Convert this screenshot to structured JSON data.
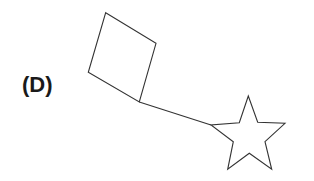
{
  "option_label": "(D)",
  "figure": {
    "stroke_color": "#333333",
    "fill_color": "#ffffff",
    "shapes": [
      {
        "name": "square",
        "points": "105.7,12.7 156,43.3 139.3,102 88.3,72.3"
      },
      {
        "name": "connector-line",
        "x1": 139.3,
        "y1": 102,
        "x2": 211,
        "y2": 125
      },
      {
        "name": "star",
        "points": "248.3,96 257.7,122.3 285,123.3 265,141.7 271.7,169.3 249.3,153.3 227.7,169.3 233.3,141.7 211,125 239.3,122.7"
      }
    ]
  }
}
